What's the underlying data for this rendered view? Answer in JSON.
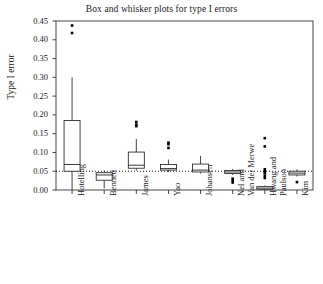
{
  "chart_data": {
    "type": "box",
    "title": "Box and whisker plots for type I errors",
    "xlabel": "",
    "ylabel": "Type I error",
    "ylim": [
      0.0,
      0.45
    ],
    "yticks": [
      0.0,
      0.05,
      0.1,
      0.15,
      0.2,
      0.25,
      0.3,
      0.35,
      0.4,
      0.45
    ],
    "ytick_labels": [
      "0.00",
      "0.05",
      "0.10",
      "0.15",
      "0.20",
      "0.25",
      "0.30",
      "0.35",
      "0.40",
      "0.45"
    ],
    "grid": false,
    "legend": null,
    "reference_line": {
      "y": 0.05,
      "style": "dotted",
      "color": "#000000"
    },
    "categories": [
      "Hotelling",
      "Bennett",
      "James",
      "Yao",
      "Johansen",
      "Nel and\nVan der Merwe",
      "Hwang and\nPaulson",
      "Kim"
    ],
    "category_lines": [
      [
        "Hotelling"
      ],
      [
        "Bennett"
      ],
      [
        "James"
      ],
      [
        "Yao"
      ],
      [
        "Johansen"
      ],
      [
        "Nel and",
        "Van der Merwe"
      ],
      [
        "Hwang and",
        "Paulson"
      ],
      [
        "Kim"
      ]
    ],
    "boxes": [
      {
        "name": "Hotelling",
        "whisker_low": 0.0,
        "q1": 0.05,
        "median": 0.068,
        "q3": 0.185,
        "whisker_high": 0.3,
        "outliers": [
          0.418,
          0.438
        ]
      },
      {
        "name": "Bennett",
        "whisker_low": 0.004,
        "q1": 0.026,
        "median": 0.04,
        "q3": 0.046,
        "whisker_high": 0.052,
        "outliers": []
      },
      {
        "name": "James",
        "whisker_low": 0.052,
        "q1": 0.058,
        "median": 0.066,
        "q3": 0.101,
        "whisker_high": 0.136,
        "outliers": [
          0.17,
          0.174,
          0.181
        ]
      },
      {
        "name": "Yao",
        "whisker_low": 0.048,
        "q1": 0.053,
        "median": 0.057,
        "q3": 0.068,
        "whisker_high": 0.081,
        "outliers": [
          0.112,
          0.122,
          0.126
        ]
      },
      {
        "name": "Johansen",
        "whisker_low": 0.044,
        "q1": 0.048,
        "median": 0.053,
        "q3": 0.069,
        "whisker_high": 0.091,
        "outliers": []
      },
      {
        "name": "Nel and Van der Merwe",
        "whisker_low": 0.04,
        "q1": 0.044,
        "median": 0.048,
        "q3": 0.052,
        "whisker_high": 0.056,
        "outliers": [
          0.02,
          0.025,
          0.03
        ]
      },
      {
        "name": "Hwang and Paulson",
        "whisker_low": 0.0,
        "q1": 0.002,
        "median": 0.005,
        "q3": 0.009,
        "whisker_high": 0.012,
        "outliers": [
          0.032,
          0.038,
          0.045,
          0.05,
          0.055,
          0.116,
          0.138
        ]
      },
      {
        "name": "Kim",
        "whisker_low": 0.036,
        "q1": 0.04,
        "median": 0.045,
        "q3": 0.05,
        "whisker_high": 0.055,
        "outliers": [
          0.021
        ]
      }
    ]
  }
}
